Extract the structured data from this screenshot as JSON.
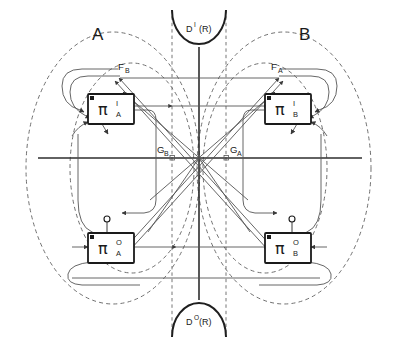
{
  "figure": {
    "background_color": "#ffffff",
    "line_color": "#3a3a3a",
    "accent_color": "#1a1a1a",
    "dashed_color": "#707070"
  },
  "regions": [
    {
      "id": "region-a",
      "label": "A",
      "side": "left"
    },
    {
      "id": "region-b",
      "label": "B",
      "side": "right"
    }
  ],
  "domains": [
    {
      "id": "domain-top",
      "base": "D",
      "superscript": "I",
      "argument": "(R)",
      "full_label": "D I(R)",
      "position": "top"
    },
    {
      "id": "domain-bottom",
      "base": "D",
      "superscript": "O",
      "argument": "(R)",
      "full_label": "D O(R)",
      "position": "bottom"
    }
  ],
  "modules": [
    {
      "id": "pi-input-a",
      "glyph": "π",
      "superscript": "I",
      "subscript": "A",
      "full_label": "π I A",
      "region": "A",
      "role": "input"
    },
    {
      "id": "pi-output-a",
      "glyph": "π",
      "superscript": "O",
      "subscript": "A",
      "full_label": "π O A",
      "region": "A",
      "role": "output"
    },
    {
      "id": "pi-input-b",
      "glyph": "π",
      "superscript": "I",
      "subscript": "B",
      "full_label": "π I B",
      "region": "B",
      "role": "input"
    },
    {
      "id": "pi-output-b",
      "glyph": "π",
      "superscript": "O",
      "subscript": "B",
      "full_label": "π O B",
      "region": "B",
      "role": "output"
    }
  ],
  "signals": [
    {
      "id": "signal-fb",
      "base": "F",
      "subscript": "B",
      "full_label": "F B",
      "side": "left"
    },
    {
      "id": "signal-fa",
      "base": "F",
      "subscript": "A",
      "full_label": "F A",
      "side": "right"
    },
    {
      "id": "signal-gb",
      "base": "G",
      "subscript": "B",
      "full_label": "G B",
      "side": "center-left"
    },
    {
      "id": "signal-ga",
      "base": "G",
      "subscript": "A",
      "full_label": "G A",
      "side": "center-right"
    }
  ]
}
